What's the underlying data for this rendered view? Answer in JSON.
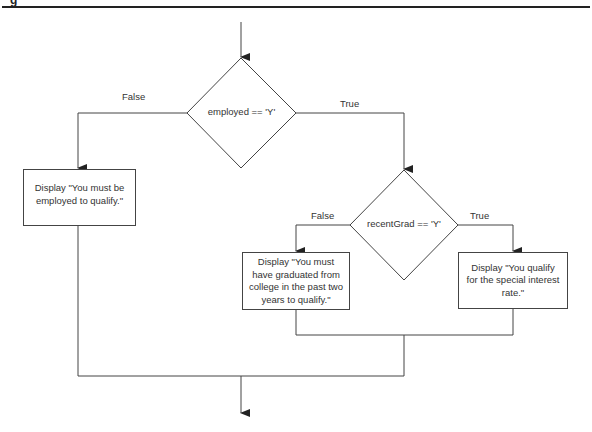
{
  "figure": {
    "header_glyph": "g",
    "decisions": [
      {
        "id": "d1",
        "condition": "employed == 'Y'"
      },
      {
        "id": "d2",
        "condition": "recentGrad == 'Y'"
      }
    ],
    "branch_labels": {
      "d1_false": "False",
      "d1_true": "True",
      "d2_false": "False",
      "d2_true": "True"
    },
    "processes": [
      {
        "id": "p1",
        "text": "Display \"You must be employed to qualify.\""
      },
      {
        "id": "p2",
        "text": "Display \"You must have graduated from college in the past two years to qualify.\""
      },
      {
        "id": "p3",
        "text": "Display \"You qualify for the special interest rate.\""
      }
    ],
    "colors": {
      "line": "#444444",
      "background": "#ffffff",
      "text": "#333333"
    }
  }
}
